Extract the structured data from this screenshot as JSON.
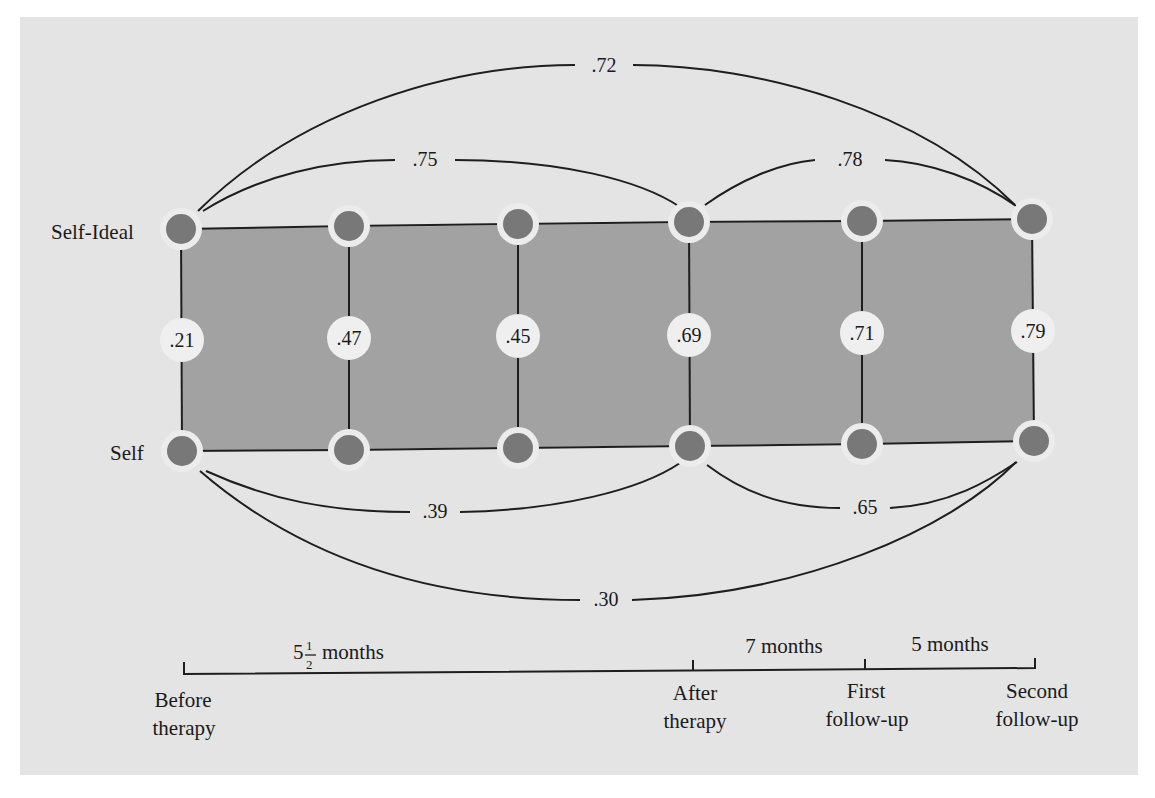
{
  "colors": {
    "panel": "#e4e4e4",
    "band": "#a2a2a2",
    "node": "#787878",
    "halo": "#ececec",
    "line": "#1e1e1e",
    "value_circle": "#efefef"
  },
  "rows": {
    "self_ideal": "Self-Ideal",
    "self": "Self"
  },
  "vertical_correlations": [
    ".21",
    ".47",
    ".45",
    ".69",
    ".71",
    ".79"
  ],
  "arcs_top": {
    "before_to_second": ".72",
    "before_to_after": ".75",
    "after_to_second": ".78"
  },
  "arcs_bottom": {
    "before_to_after": ".39",
    "after_to_second": ".65",
    "before_to_second": ".30"
  },
  "timeline": {
    "intervals": {
      "first": {
        "whole": "5",
        "num": "1",
        "den": "2",
        "unit": "months"
      },
      "second": "7 months",
      "third": "5 months"
    },
    "points": [
      {
        "line1": "Before",
        "line2": "therapy"
      },
      {
        "line1": "After",
        "line2": "therapy"
      },
      {
        "line1": "First",
        "line2": "follow-up"
      },
      {
        "line1": "Second",
        "line2": "follow-up"
      }
    ]
  }
}
